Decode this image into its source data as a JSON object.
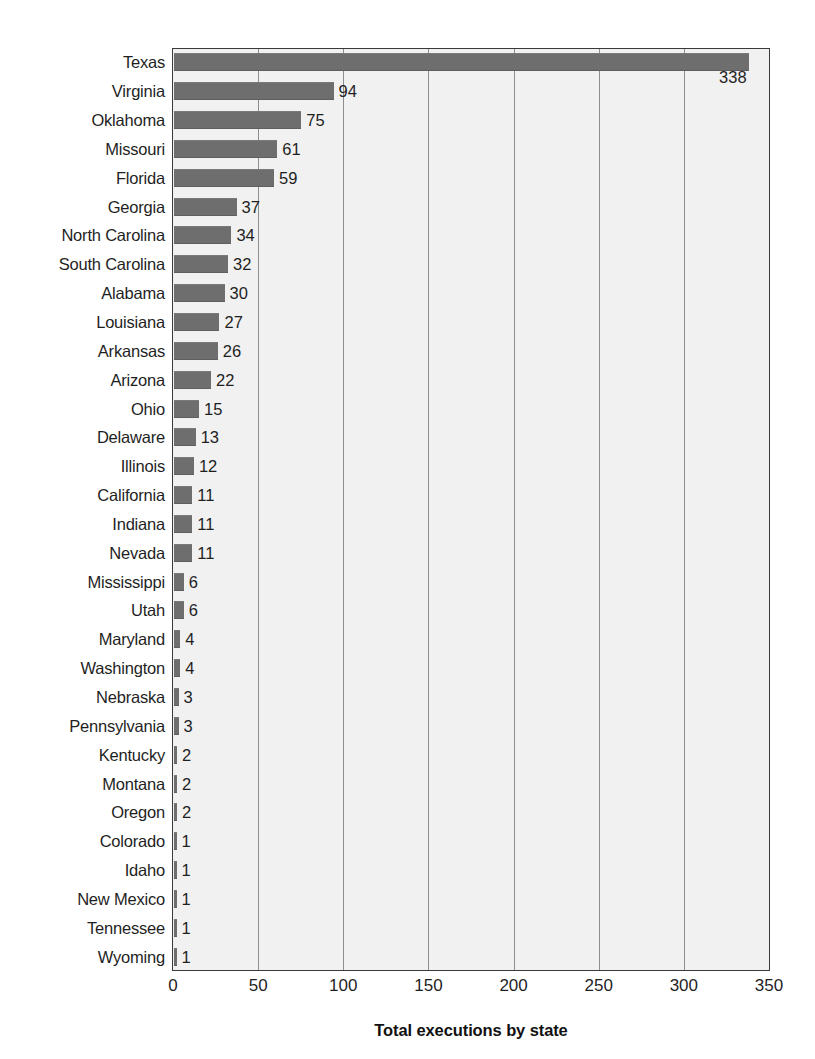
{
  "chart_data": {
    "type": "bar",
    "orientation": "horizontal",
    "title": "",
    "xlabel": "Total executions by state",
    "ylabel": "",
    "xlim": [
      0,
      350
    ],
    "xticks": [
      "0",
      "50",
      "100",
      "150",
      "200",
      "250",
      "300",
      "350"
    ],
    "grid": "vertical",
    "legend": "none",
    "bar_color": "#6e6e6e",
    "plot_background": "#f1f1f1",
    "categories": [
      "Texas",
      "Virginia",
      "Oklahoma",
      "Missouri",
      "Florida",
      "Georgia",
      "North Carolina",
      "South Carolina",
      "Alabama",
      "Louisiana",
      "Arkansas",
      "Arizona",
      "Ohio",
      "Delaware",
      "Illinois",
      "California",
      "Indiana",
      "Nevada",
      "Mississippi",
      "Utah",
      "Maryland",
      "Washington",
      "Nebraska",
      "Pennsylvania",
      "Kentucky",
      "Montana",
      "Oregon",
      "Colorado",
      "Idaho",
      "New Mexico",
      "Tennessee",
      "Wyoming"
    ],
    "values": [
      338,
      94,
      75,
      61,
      59,
      37,
      34,
      32,
      30,
      27,
      26,
      22,
      15,
      13,
      12,
      11,
      11,
      11,
      6,
      6,
      4,
      4,
      3,
      3,
      2,
      2,
      2,
      1,
      1,
      1,
      1,
      1
    ],
    "data_labels": [
      "338",
      "94",
      "75",
      "61",
      "59",
      "37",
      "34",
      "32",
      "30",
      "27",
      "26",
      "22",
      "15",
      "13",
      "12",
      "11",
      "11",
      "11",
      "6",
      "6",
      "4",
      "4",
      "3",
      "3",
      "2",
      "2",
      "2",
      "1",
      "1",
      "1",
      "1",
      "1"
    ]
  }
}
